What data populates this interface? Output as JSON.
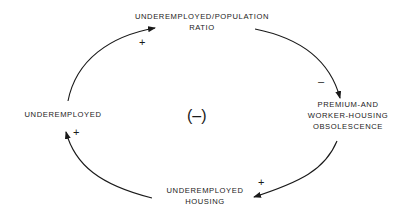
{
  "diagram": {
    "type": "causal-loop",
    "loop_polarity": "(–)",
    "nodes": {
      "top": {
        "lines": [
          "UNDEREMPLOYED/POPULATION",
          "RATIO"
        ]
      },
      "right": {
        "lines": [
          "PREMIUM-AND",
          "WORKER-HOUSING",
          "OBSOLESCENCE"
        ]
      },
      "bottom": {
        "lines": [
          "UNDEREMPLOYED",
          "HOUSING"
        ]
      },
      "left": {
        "lines": [
          "UNDEREMPLOYED"
        ]
      }
    },
    "links": [
      {
        "from": "UNDEREMPLOYED",
        "to": "UNDEREMPLOYED/POPULATION RATIO",
        "sign": "+"
      },
      {
        "from": "UNDEREMPLOYED/POPULATION RATIO",
        "to": "PREMIUM-AND WORKER-HOUSING OBSOLESCENCE",
        "sign": "–"
      },
      {
        "from": "PREMIUM-AND WORKER-HOUSING OBSOLESCENCE",
        "to": "UNDEREMPLOYED HOUSING",
        "sign": "+"
      },
      {
        "from": "UNDEREMPLOYED HOUSING",
        "to": "UNDEREMPLOYED",
        "sign": "+"
      }
    ],
    "colors": {
      "ink": "#1a1a1a",
      "background": "#ffffff"
    }
  }
}
